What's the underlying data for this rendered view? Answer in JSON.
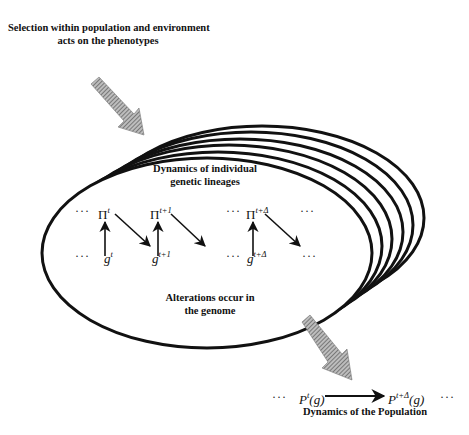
{
  "diagram": {
    "top_label": {
      "line1": "Selection within population and environment",
      "line2": "acts on the phenotypes"
    },
    "inner_top_label": {
      "line1": "Dynamics of individual",
      "line2": "genetic lineages"
    },
    "inner_bottom_label": {
      "line1": "Alterations occur in",
      "line2": "the genome"
    },
    "lineage": {
      "ellipsis": "···",
      "phenotype_symbol": "Π",
      "genotype_symbol": "g",
      "superscripts": {
        "t": "t",
        "t_plus_1": "t+1",
        "t_plus_delta": "t+Δ"
      }
    },
    "population": {
      "ellipsis": "···",
      "left_term_base": "P",
      "left_term_sup": "t",
      "left_term_arg": "(g)",
      "right_term_base": "P",
      "right_term_sup": "t+Δ",
      "right_term_arg": "(g)",
      "label": "Dynamics of the Population"
    },
    "stack": {
      "layer_count": 6
    },
    "colors": {
      "line": "#111111",
      "hatched_arrow": "#8a8a8a",
      "background": "#ffffff"
    }
  }
}
